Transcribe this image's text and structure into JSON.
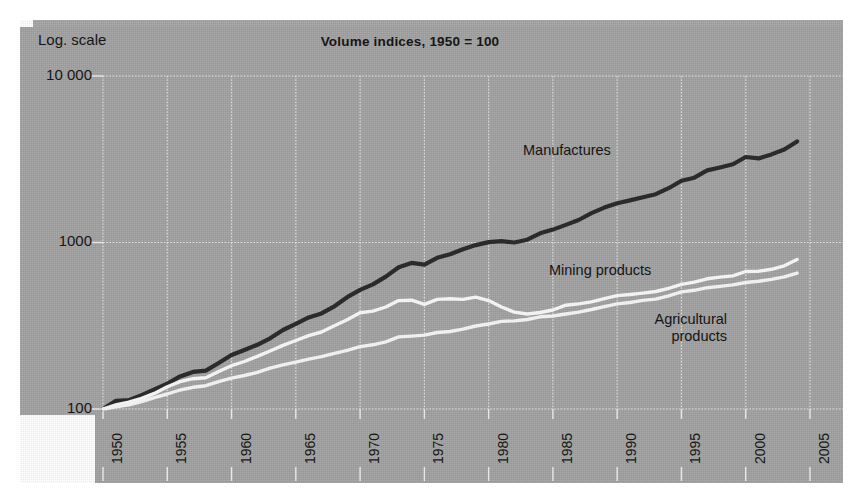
{
  "figure": {
    "axis_note": "Log. scale",
    "title": "Volume indices, 1950 = 100",
    "bottom_caption": ""
  },
  "labels": {
    "manufactures": "Manufactures",
    "mining": "Mining products",
    "agricultural": "Agricultural\nproducts"
  },
  "colors": {
    "panel": "#a2a2a2",
    "grid": "#e8e8e8",
    "manufactures": "#2b2b2b",
    "mining": "#f2f2f2",
    "agricultural": "#efefef",
    "text": "#161616"
  },
  "chart_data": {
    "type": "line",
    "title": "Volume indices, 1950 = 100",
    "xlabel": "",
    "ylabel": "Log. scale",
    "yscale": "log",
    "ylim": [
      100,
      10000
    ],
    "ytick_labels": [
      "100",
      "1000",
      "10 000"
    ],
    "yticks": [
      100,
      1000,
      10000
    ],
    "xlim": [
      1950,
      2005
    ],
    "xticks": [
      1950,
      1955,
      1960,
      1965,
      1970,
      1975,
      1980,
      1985,
      1990,
      1995,
      2000,
      2005
    ],
    "xtick_labels": [
      "1950",
      "1955",
      "1960",
      "1965",
      "1970",
      "1975",
      "1980",
      "1985",
      "1990",
      "1995",
      "2000",
      "2005"
    ],
    "grid": true,
    "legend": "inline-annotations",
    "x": [
      1950,
      1951,
      1952,
      1953,
      1954,
      1955,
      1956,
      1957,
      1958,
      1959,
      1960,
      1961,
      1962,
      1963,
      1964,
      1965,
      1966,
      1967,
      1968,
      1969,
      1970,
      1971,
      1972,
      1973,
      1974,
      1975,
      1976,
      1977,
      1978,
      1979,
      1980,
      1981,
      1982,
      1983,
      1984,
      1985,
      1986,
      1987,
      1988,
      1989,
      1990,
      1991,
      1992,
      1993,
      1994,
      1995,
      1996,
      1997,
      1998,
      1999,
      2000,
      2001,
      2002,
      2003,
      2004
    ],
    "series": [
      {
        "name": "Manufactures",
        "color": "#2b2b2b",
        "values": [
          100,
          112,
          113,
          121,
          131,
          142,
          157,
          167,
          170,
          189,
          211,
          226,
          243,
          266,
          298,
          325,
          355,
          375,
          414,
          469,
          519,
          560,
          624,
          711,
          754,
          737,
          809,
          850,
          910,
          965,
          1005,
          1020,
          1000,
          1040,
          1135,
          1195,
          1275,
          1365,
          1500,
          1620,
          1720,
          1790,
          1870,
          1950,
          2120,
          2350,
          2450,
          2710,
          2820,
          2950,
          3260,
          3200,
          3380,
          3620,
          4050
        ]
      },
      {
        "name": "Mining products",
        "color": "#f2f2f2",
        "values": [
          100,
          106,
          110,
          116,
          124,
          136,
          146,
          152,
          154,
          168,
          182,
          193,
          207,
          223,
          241,
          258,
          276,
          290,
          316,
          344,
          378,
          387,
          410,
          448,
          450,
          425,
          455,
          460,
          455,
          470,
          448,
          410,
          382,
          372,
          380,
          393,
          420,
          428,
          440,
          460,
          480,
          487,
          497,
          508,
          530,
          560,
          578,
          605,
          620,
          630,
          670,
          672,
          690,
          725,
          790
        ]
      },
      {
        "name": "Agricultural products",
        "color": "#efefef",
        "values": [
          100,
          103,
          106,
          111,
          117,
          123,
          130,
          135,
          138,
          146,
          153,
          159,
          166,
          176,
          184,
          191,
          199,
          206,
          216,
          225,
          237,
          243,
          253,
          271,
          274,
          278,
          288,
          292,
          302,
          315,
          324,
          336,
          338,
          345,
          358,
          362,
          372,
          382,
          396,
          412,
          428,
          436,
          449,
          457,
          478,
          505,
          516,
          535,
          545,
          556,
          575,
          585,
          600,
          622,
          655
        ]
      }
    ]
  }
}
